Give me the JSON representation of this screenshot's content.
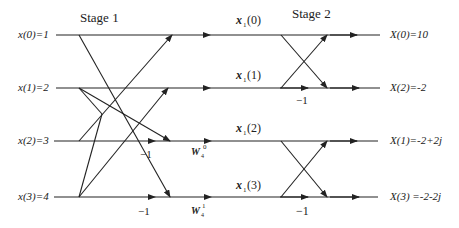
{
  "diagram": {
    "type": "4-point DIF FFT butterfly diagram",
    "stages": [
      {
        "label": "Stage 1"
      },
      {
        "label": "Stage 2"
      }
    ],
    "inputs": [
      {
        "label": "x(0)=1"
      },
      {
        "label": "x(1)=2"
      },
      {
        "label": "x(2)=3"
      },
      {
        "label": "x(3)=4"
      }
    ],
    "intermediate": [
      {
        "base": "x",
        "sub": "1",
        "arg": "(0)"
      },
      {
        "base": "x",
        "sub": "1",
        "arg": "(1)"
      },
      {
        "base": "x",
        "sub": "1",
        "arg": "(2)"
      },
      {
        "base": "x",
        "sub": "1",
        "arg": "(3)"
      }
    ],
    "outputs": [
      {
        "label": "X(0)=10"
      },
      {
        "label": "X(2)=-2"
      },
      {
        "label": "X(1)=-2+2j"
      },
      {
        "label": "X(3) =-2-2j"
      }
    ],
    "multipliers": {
      "stage1_row2": "−1",
      "stage1_row3": "−1",
      "stage2_row1": "−1",
      "stage2_row3": "−1"
    },
    "twiddles": [
      {
        "base": "W",
        "sub": "4",
        "sup": "0"
      },
      {
        "base": "W",
        "sub": "4",
        "sup": "1"
      }
    ],
    "colors": {
      "line": "#222222",
      "background": "#ffffff"
    }
  }
}
